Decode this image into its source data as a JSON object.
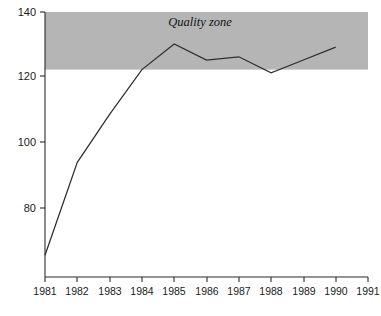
{
  "chart_data": {
    "type": "line",
    "title": "",
    "xlabel": "",
    "ylabel": "",
    "x": [
      1981,
      1982,
      1983,
      1984,
      1985,
      1986,
      1987,
      1988,
      1989,
      1990
    ],
    "values": [
      64,
      93,
      108,
      122,
      130,
      125,
      126,
      121,
      125,
      129
    ],
    "series": [
      {
        "name": "",
        "values": [
          64,
          93,
          108,
          122,
          130,
          125,
          126,
          121,
          125,
          129
        ]
      }
    ],
    "xlim": [
      1981,
      1991
    ],
    "ylim": [
      60,
      140
    ],
    "xticks": [
      1981,
      1982,
      1983,
      1984,
      1985,
      1986,
      1987,
      1988,
      1989,
      1990,
      1991
    ],
    "xticklabels": [
      "1981",
      "1982",
      "1983",
      "1984",
      "1985",
      "1986",
      "1987",
      "1988",
      "1989",
      "1990",
      "1991"
    ],
    "yticks": [
      80,
      100,
      120,
      140
    ],
    "yticklabels": [
      "80",
      "100",
      "120",
      "140"
    ],
    "grid": false,
    "legend": false,
    "annotations": [
      {
        "text": "Quality zone",
        "x": 1985.8,
        "y": 135.5,
        "style": "italic"
      }
    ],
    "shaded_regions": [
      {
        "label": "Quality zone",
        "y_from": 122,
        "y_to": 140,
        "color": "#b5b5b5"
      }
    ],
    "colors": {
      "line": "#2e2e2e",
      "axis": "#2b2b2b",
      "band": "#b5b5b5",
      "background": "#ffffff",
      "text": "#1a1a1a"
    }
  }
}
